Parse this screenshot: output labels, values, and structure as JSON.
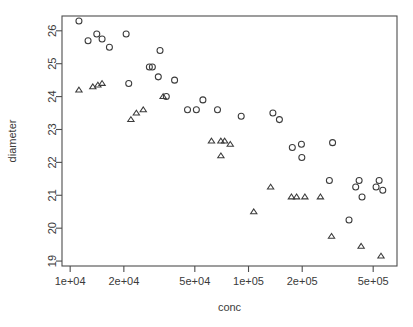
{
  "chart_data": {
    "type": "scatter",
    "title": "",
    "xlabel": "conc",
    "ylabel": "diameter",
    "xscale": "log",
    "yscale": "linear",
    "grid": false,
    "legend": "none",
    "xlim": [
      9000,
      680000
    ],
    "ylim": [
      18.85,
      26.45
    ],
    "xticks": [
      10000,
      20000,
      50000,
      100000,
      200000,
      500000
    ],
    "xticklabels": [
      "1e+04",
      "2e+04",
      "5e+04",
      "1e+05",
      "2e+05",
      "5e+05"
    ],
    "yticks": [
      19,
      20,
      21,
      22,
      23,
      24,
      25,
      26
    ],
    "yticklabels": [
      "19",
      "20",
      "21",
      "22",
      "23",
      "24",
      "25",
      "26"
    ],
    "series": [
      {
        "name": "circle-group",
        "marker": "circle",
        "color": "#3b3b3b",
        "points": [
          {
            "x": 11200,
            "y": 26.3
          },
          {
            "x": 12600,
            "y": 25.7
          },
          {
            "x": 14100,
            "y": 25.9
          },
          {
            "x": 15100,
            "y": 25.75
          },
          {
            "x": 16600,
            "y": 25.5
          },
          {
            "x": 20600,
            "y": 25.9
          },
          {
            "x": 21300,
            "y": 24.4
          },
          {
            "x": 27800,
            "y": 24.9
          },
          {
            "x": 28900,
            "y": 24.9
          },
          {
            "x": 31900,
            "y": 25.4
          },
          {
            "x": 31200,
            "y": 24.6
          },
          {
            "x": 34600,
            "y": 24.0
          },
          {
            "x": 38500,
            "y": 24.5
          },
          {
            "x": 45500,
            "y": 23.6
          },
          {
            "x": 51000,
            "y": 23.6
          },
          {
            "x": 55500,
            "y": 23.9
          },
          {
            "x": 67000,
            "y": 23.6
          },
          {
            "x": 91000,
            "y": 23.4
          },
          {
            "x": 137000,
            "y": 23.5
          },
          {
            "x": 149000,
            "y": 23.3
          },
          {
            "x": 176000,
            "y": 22.45
          },
          {
            "x": 198000,
            "y": 22.55
          },
          {
            "x": 199000,
            "y": 22.15
          },
          {
            "x": 296000,
            "y": 22.6
          },
          {
            "x": 284000,
            "y": 21.45
          },
          {
            "x": 366000,
            "y": 20.25
          },
          {
            "x": 399000,
            "y": 21.25
          },
          {
            "x": 417000,
            "y": 21.45
          },
          {
            "x": 433000,
            "y": 20.95
          },
          {
            "x": 519000,
            "y": 21.25
          },
          {
            "x": 540000,
            "y": 21.45
          },
          {
            "x": 566000,
            "y": 21.15
          }
        ]
      },
      {
        "name": "triangle-group",
        "marker": "triangle",
        "color": "#3b3b3b",
        "points": [
          {
            "x": 11200,
            "y": 24.2
          },
          {
            "x": 13400,
            "y": 24.3
          },
          {
            "x": 14300,
            "y": 24.35
          },
          {
            "x": 15100,
            "y": 24.4
          },
          {
            "x": 21900,
            "y": 23.3
          },
          {
            "x": 23500,
            "y": 23.5
          },
          {
            "x": 25700,
            "y": 23.6
          },
          {
            "x": 33200,
            "y": 24.0
          },
          {
            "x": 62000,
            "y": 22.65
          },
          {
            "x": 70000,
            "y": 22.65
          },
          {
            "x": 73500,
            "y": 22.65
          },
          {
            "x": 79000,
            "y": 22.55
          },
          {
            "x": 70000,
            "y": 22.2
          },
          {
            "x": 107000,
            "y": 20.5
          },
          {
            "x": 133000,
            "y": 21.25
          },
          {
            "x": 174000,
            "y": 20.95
          },
          {
            "x": 186000,
            "y": 20.95
          },
          {
            "x": 207000,
            "y": 20.95
          },
          {
            "x": 253000,
            "y": 20.95
          },
          {
            "x": 292000,
            "y": 19.75
          },
          {
            "x": 428000,
            "y": 19.45
          },
          {
            "x": 553000,
            "y": 19.15
          }
        ]
      }
    ]
  }
}
